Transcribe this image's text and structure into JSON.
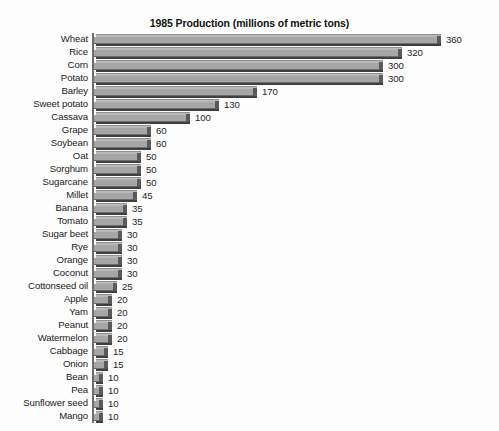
{
  "chart_data": {
    "type": "bar",
    "orientation": "horizontal",
    "title": "1985 Production (millions of metric tons)",
    "subtitle": "",
    "xlabel": "",
    "ylabel": "",
    "xlim": [
      0,
      360
    ],
    "ylim": null,
    "grid": false,
    "legend": null,
    "style": "3d-shaded-horizontal-bars",
    "value_labels_shown": true,
    "units": "millions of metric tons",
    "year": "1985",
    "categories": [
      "Wheat",
      "Rice",
      "Corn",
      "Potato",
      "Barley",
      "Sweet potato",
      "Cassava",
      "Grape",
      "Soybean",
      "Oat",
      "Sorghum",
      "Sugarcane",
      "Millet",
      "Banana",
      "Tomato",
      "Sugar beet",
      "Rye",
      "Orange",
      "Coconut",
      "Cottonseed oil",
      "Apple",
      "Yam",
      "Peanut",
      "Watermelon",
      "Cabbage",
      "Onion",
      "Bean",
      "Pea",
      "Sunflower seed",
      "Mango"
    ],
    "values": [
      360,
      320,
      300,
      300,
      170,
      130,
      100,
      60,
      60,
      50,
      50,
      50,
      45,
      35,
      35,
      30,
      30,
      30,
      30,
      25,
      20,
      20,
      20,
      20,
      15,
      15,
      10,
      10,
      10,
      10
    ],
    "value_labels": [
      "360",
      "320",
      "300",
      "300",
      "170",
      "130",
      "100",
      "60",
      "60",
      "50",
      "50",
      "50",
      "45",
      "35",
      "35",
      "30",
      "30",
      "30",
      "30",
      "25",
      "20",
      "20",
      "20",
      "20",
      "15",
      "15",
      "10",
      "10",
      "10",
      "10"
    ]
  },
  "colors": {
    "background": "#fdfdfd",
    "bar_top_face": "#b9b9b9",
    "bar_front_face": "#a6a6a6",
    "bar_end_cap": "#5a5a5a",
    "bar_shadow": "#3f3f3f",
    "bar_outline": "#6d6d6d",
    "text": "#1b1b1b",
    "title_text": "#121212"
  }
}
